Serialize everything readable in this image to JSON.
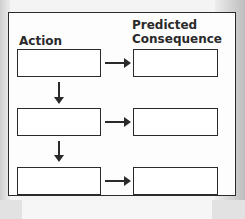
{
  "diagram": {
    "headers": {
      "action": "Action",
      "consequence_line1": "Predicted",
      "consequence_line2": "Consequence"
    },
    "rows": [
      {
        "action_box": "",
        "consequence_box": ""
      },
      {
        "action_box": "",
        "consequence_box": ""
      },
      {
        "action_box": "",
        "consequence_box": ""
      }
    ],
    "colors": {
      "stroke": "#2a2a2a",
      "fill": "#ffffff"
    }
  }
}
